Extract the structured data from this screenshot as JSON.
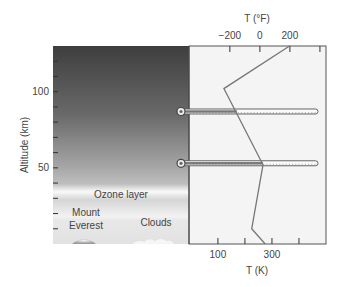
{
  "chart_data": {
    "type": "line",
    "title": "",
    "ylabel": "Altitude (km)",
    "xlabel_bottom": "T (K)",
    "xlabel_top": "T (°F)",
    "ylim": [
      0,
      130
    ],
    "xlim_K": [
      -7,
      500
    ],
    "y_ticks": [
      {
        "value": 100,
        "label": "100"
      },
      {
        "value": 50,
        "label": "50"
      }
    ],
    "y_minor_ticks": [
      10,
      20,
      30,
      40,
      60,
      70,
      80,
      90,
      110,
      120
    ],
    "x_bottom_ticks": [
      {
        "value": 100,
        "label": "100"
      },
      {
        "value": 200,
        "label": ""
      },
      {
        "value": 300,
        "label": "300"
      },
      {
        "value": 400,
        "label": ""
      }
    ],
    "x_top_ticks_F": [
      {
        "value": -200,
        "label": "−200"
      },
      {
        "value": 0,
        "label": "0"
      },
      {
        "value": 200,
        "label": "200"
      },
      {
        "value": 400,
        "label": ""
      }
    ],
    "series": [
      {
        "name": "Temperature profile",
        "points": [
          {
            "T_K": 365,
            "alt_km": 130
          },
          {
            "T_K": 122,
            "alt_km": 102
          },
          {
            "T_K": 267,
            "alt_km": 52
          },
          {
            "T_K": 225,
            "alt_km": 10
          },
          {
            "T_K": 275,
            "alt_km": 0
          }
        ]
      }
    ],
    "thermometers": [
      {
        "alt_km": 87,
        "reading_K": 170
      },
      {
        "alt_km": 53,
        "reading_K": 267
      }
    ],
    "annotations": [
      {
        "text": "Ozone layer",
        "alt_km": 32
      },
      {
        "text": "Mount",
        "alt_km": 19
      },
      {
        "text": "Everest",
        "alt_km": 11
      },
      {
        "text": "Clouds",
        "alt_km": 14
      }
    ]
  }
}
